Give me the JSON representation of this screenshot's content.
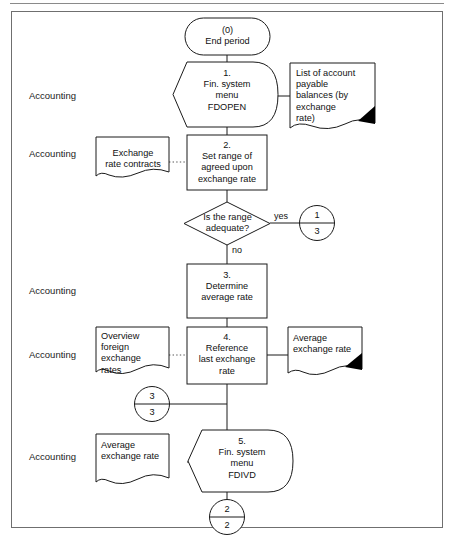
{
  "diagram": {
    "lanes": [
      {
        "id": "lane-1",
        "label": "Accounting"
      },
      {
        "id": "lane-2",
        "label": "Accounting"
      },
      {
        "id": "lane-3",
        "label": "Accounting"
      },
      {
        "id": "lane-4",
        "label": "Accounting"
      },
      {
        "id": "lane-5",
        "label": "Accounting"
      }
    ],
    "nodes": {
      "start": {
        "step": "(0)",
        "label": "End period",
        "text": "(0)\nEnd period",
        "shape": "terminator"
      },
      "step1": {
        "step": "1.",
        "label": "Fin. system menu FDOPEN",
        "text": "1.\nFin. system\nmenu\nFDOPEN",
        "shape": "manual-operation"
      },
      "doc_payables": {
        "label": "List of account payable balances (by exchange rate)",
        "text": "List of account\npayable\nbalances (by\nexchange\nrate)",
        "shape": "document-printed"
      },
      "doc_contracts": {
        "label": "Exchange rate contracts",
        "text": "Exchange\nrate contracts",
        "shape": "document"
      },
      "step2": {
        "step": "2.",
        "label": "Set range of agreed upon exchange rate",
        "text": "2.\nSet range of\nagreed upon\nexchange rate",
        "shape": "process"
      },
      "decision": {
        "label": "Is the range adequate?",
        "text": "Is the range\nadequate?",
        "shape": "decision"
      },
      "step3": {
        "step": "3.",
        "label": "Determine average rate",
        "text": "3.\nDetermine\naverage rate",
        "shape": "process"
      },
      "doc_overview": {
        "label": "Overview foreign exchange rates",
        "text": "Overview\nforeign\nexchange\nrates",
        "shape": "document"
      },
      "step4": {
        "step": "4.",
        "label": "Reference last exchange rate",
        "text": "4.\nReference\nlast exchange\nrate",
        "shape": "process"
      },
      "doc_avg_out": {
        "label": "Average exchange rate",
        "text": "Average\nexchange rate",
        "shape": "document-printed"
      },
      "doc_avg_in": {
        "label": "Average exchange rate",
        "text": "Average\nexchange rate",
        "shape": "document"
      },
      "step5": {
        "step": "5.",
        "label": "Fin. system menu FDIVD",
        "text": "5.\nFin. system\nmenu\nFDIVD",
        "shape": "manual-operation"
      }
    },
    "connectors": [
      {
        "id": "connector-yes",
        "top": "1",
        "bottom": "3"
      },
      {
        "id": "connector-mid",
        "top": "3",
        "bottom": "3"
      },
      {
        "id": "connector-end",
        "top": "2",
        "bottom": "2"
      }
    ],
    "edge_labels": {
      "yes": "yes",
      "no": "no"
    },
    "colors": {
      "stroke": "#1a1a1a",
      "frame": "#6f6f6f",
      "fill": "#ffffff",
      "text": "#111111",
      "dotted": "#555555",
      "corner_mark": "#000000"
    }
  }
}
